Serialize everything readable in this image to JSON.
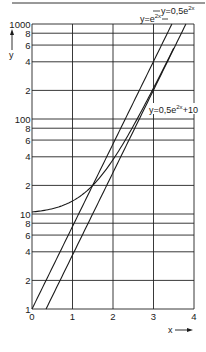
{
  "chart_data": {
    "type": "line",
    "title": "",
    "xlabel": "x",
    "ylabel": "y",
    "xscale": "linear",
    "yscale": "log",
    "xlim": [
      0,
      4
    ],
    "ylim": [
      1,
      1000
    ],
    "grid": true,
    "x_ticks": [
      "0",
      "1",
      "2",
      "3",
      "4"
    ],
    "y_tick_labels": [
      "1",
      "2",
      "4",
      "6",
      "8",
      "10",
      "2",
      "4",
      "6",
      "8",
      "100",
      "2",
      "4",
      "6",
      "8",
      "1000"
    ],
    "y_tick_values": [
      1,
      2,
      4,
      6,
      8,
      10,
      20,
      40,
      60,
      80,
      100,
      200,
      400,
      600,
      800,
      1000
    ],
    "series": [
      {
        "name": "y=e^2x",
        "label": "y=e",
        "label_exp": "2x",
        "x": [
          0,
          0.5,
          1,
          1.5,
          2,
          2.5,
          3,
          3.454
        ],
        "values": [
          1,
          2.72,
          7.39,
          20.09,
          54.6,
          148.4,
          403.4,
          1000
        ]
      },
      {
        "name": "y=0.5e^2x",
        "label": "y=0,5e",
        "label_exp": "2x",
        "x": [
          0.347,
          0.5,
          1,
          1.5,
          2,
          2.5,
          3,
          3.5,
          3.8
        ],
        "values": [
          1,
          1.36,
          3.69,
          10.04,
          27.3,
          74.2,
          201.7,
          548.3,
          1000
        ]
      },
      {
        "name": "y=0.5e^2x+10",
        "label": "y=0,5e",
        "label_exp": "2x",
        "label_suffix": "+10",
        "x": [
          0,
          0.5,
          1,
          1.5,
          2,
          2.5,
          3,
          3.5
        ],
        "values": [
          10.5,
          11.36,
          13.69,
          20.04,
          37.3,
          84.2,
          211.7,
          558.3
        ]
      }
    ],
    "annotations": [
      {
        "text": "y=0,5e^2x",
        "near": "top right"
      },
      {
        "text": "y=e^2x",
        "near": "upper middle"
      },
      {
        "text": "y=0,5e^2x+10",
        "near": "y≈100, x≈3"
      }
    ]
  },
  "axes": {
    "x_label": "x",
    "y_label": "y",
    "x_ticks": [
      "0",
      "1",
      "2",
      "3",
      "4"
    ],
    "y_major": [
      "1",
      "10",
      "100",
      "1000"
    ],
    "y_minor": [
      "2",
      "4",
      "6",
      "8"
    ]
  },
  "labels": {
    "curve_a": "y=0,5e",
    "curve_a_exp": "2x",
    "curve_b": "y=e",
    "curve_b_exp": "2x",
    "curve_c": "y=0,5e",
    "curve_c_exp": "2x",
    "curve_c_suffix": "+10"
  }
}
